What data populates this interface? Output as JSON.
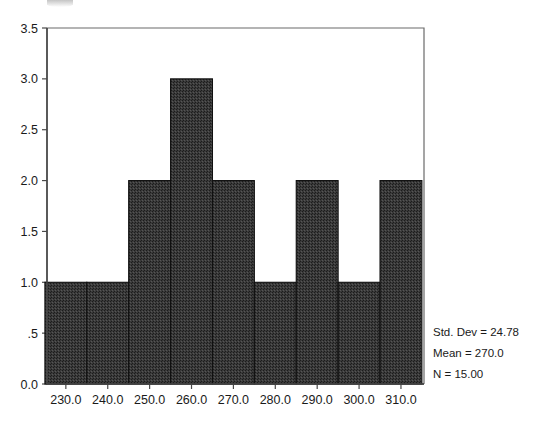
{
  "chart_data": {
    "type": "bar",
    "title": "",
    "subtitle": "",
    "xlabel": "",
    "ylabel": "",
    "grid": false,
    "legend": "none",
    "bin_width": 10,
    "bin_edges": [
      225,
      235,
      245,
      255,
      265,
      275,
      285,
      295,
      305,
      315
    ],
    "categories": [
      "225-235",
      "235-245",
      "245-255",
      "255-265",
      "265-275",
      "275-285",
      "285-295",
      "295-305",
      "305-315"
    ],
    "bin_centers": [
      230,
      240,
      250,
      260,
      270,
      280,
      290,
      300,
      310
    ],
    "values": [
      1,
      1,
      2,
      3,
      2,
      1,
      2,
      1,
      2
    ],
    "xlim": [
      225.5,
      315.5
    ],
    "ylim": [
      0,
      3.5
    ],
    "x_ticks": [
      230,
      240,
      250,
      260,
      270,
      280,
      290,
      300,
      310
    ],
    "x_tick_labels": [
      "230.0",
      "240.0",
      "250.0",
      "260.0",
      "270.0",
      "280.0",
      "290.0",
      "300.0",
      "310.0"
    ],
    "y_ticks": [
      0,
      0.5,
      1.0,
      1.5,
      2.0,
      2.5,
      3.0,
      3.5
    ],
    "y_tick_labels": [
      "0.0",
      ".5",
      "1.0",
      "1.5",
      "2.0",
      "2.5",
      "3.0",
      "3.5"
    ],
    "annotations": [
      "Std. Dev = 24.78",
      "Mean = 270.0",
      "N = 15.00"
    ],
    "statistics": {
      "std_dev": 24.78,
      "mean": 270.0,
      "n": 15.0
    },
    "colors": {
      "bar_fill": "#3a3a3a",
      "bar_stroke": "#101010",
      "axis": "#4a4a4a",
      "frame": "#6a6a6a",
      "text": "#1a1a1a",
      "background": "#ffffff"
    }
  }
}
